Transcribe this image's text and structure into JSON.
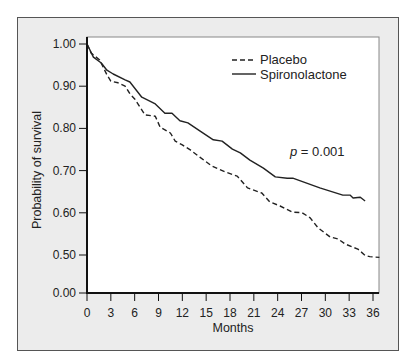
{
  "chart_data": {
    "type": "line",
    "title": "",
    "xlabel": "Months",
    "ylabel": "Probability of survival",
    "x_ticks": [
      0,
      3,
      6,
      9,
      12,
      15,
      18,
      21,
      24,
      27,
      30,
      33,
      36
    ],
    "y_ticks": [
      "0.00",
      "0.50",
      "0.60",
      "0.70",
      "0.80",
      "0.90",
      "1.00"
    ],
    "y_axis_break": "between 0.00 and 0.50",
    "xlim": [
      0,
      36.8
    ],
    "ylim": [
      0.0,
      1.0
    ],
    "grid": false,
    "legend_position": "top-right",
    "annotation": {
      "italic": "p",
      "text": " = 0.001"
    },
    "series": [
      {
        "name": "Placebo",
        "style": "dashed",
        "color": "#222222",
        "x": [
          0,
          0.5,
          1.6,
          2.5,
          3.0,
          3.9,
          4.8,
          5.4,
          6.0,
          7.3,
          8.6,
          9.2,
          10.5,
          11.1,
          12.0,
          13.0,
          14.2,
          15.7,
          17.4,
          18.9,
          20.2,
          22.0,
          23.0,
          24.3,
          25.8,
          27.1,
          28.1,
          29.1,
          30.6,
          31.6,
          32.5,
          33.4,
          34.1,
          35.0,
          35.6,
          36.8
        ],
        "y": [
          1.0,
          0.979,
          0.962,
          0.927,
          0.912,
          0.908,
          0.9,
          0.882,
          0.87,
          0.832,
          0.829,
          0.803,
          0.789,
          0.77,
          0.761,
          0.749,
          0.732,
          0.711,
          0.697,
          0.687,
          0.659,
          0.647,
          0.626,
          0.616,
          0.602,
          0.6,
          0.588,
          0.564,
          0.543,
          0.538,
          0.526,
          0.519,
          0.514,
          0.495,
          0.479,
          0.469
        ]
      },
      {
        "name": "Spironolactone",
        "style": "solid",
        "color": "#222222",
        "x": [
          0,
          0.8,
          1.8,
          2.5,
          3.3,
          4.8,
          5.4,
          6.9,
          8.6,
          9.8,
          10.7,
          11.7,
          12.7,
          14.2,
          15.9,
          17.0,
          18.3,
          19.3,
          20.5,
          22.2,
          23.7,
          25.2,
          25.9,
          29.3,
          32.2,
          33.1,
          33.5,
          34.4,
          35.0
        ],
        "y": [
          1.0,
          0.969,
          0.955,
          0.938,
          0.929,
          0.915,
          0.91,
          0.874,
          0.858,
          0.836,
          0.836,
          0.818,
          0.813,
          0.794,
          0.773,
          0.77,
          0.751,
          0.742,
          0.725,
          0.706,
          0.685,
          0.682,
          0.682,
          0.659,
          0.642,
          0.642,
          0.635,
          0.637,
          0.628
        ]
      }
    ]
  },
  "legend": {
    "items": [
      {
        "label": "Placebo",
        "style": "dashed"
      },
      {
        "label": "Spironolactone",
        "style": "solid"
      }
    ]
  },
  "colors": {
    "panel_background": "#ececec",
    "plot_background": "#ffffff",
    "line": "#222222"
  }
}
